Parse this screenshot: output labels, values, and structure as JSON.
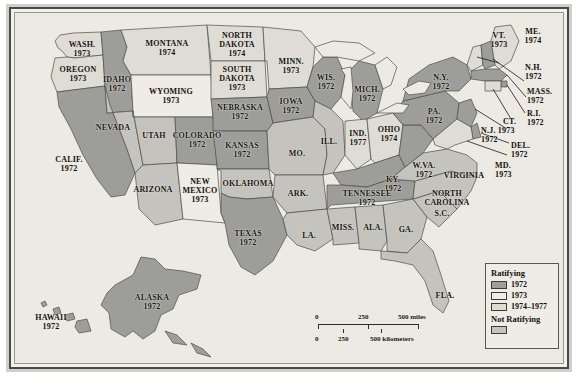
{
  "map": {
    "title": "Ratification of the Equal Rights Amendment by State",
    "projection": "united-states-with-insets",
    "background_color": "#eceae3",
    "colors": {
      "ratifying_1972": "#9d9d99",
      "ratifying_1973": "#eeece5",
      "ratifying_1974_1977": "#dedcd4",
      "not_ratifying": "#c4c3bd",
      "border": "#585753",
      "text": "#121210"
    },
    "legend": {
      "title": "Ratifying",
      "items": [
        {
          "swatch": "ratifying_1972",
          "label": "1972"
        },
        {
          "swatch": "ratifying_1973",
          "label": "1973"
        },
        {
          "swatch": "ratifying_1974_1977",
          "label": "1974–1977"
        }
      ],
      "title2": "Not Ratifying",
      "items2": [
        {
          "swatch": "not_ratifying",
          "label": ""
        }
      ]
    },
    "scale_bar": {
      "miles": {
        "ticks": [
          "0",
          "250",
          "500 miles"
        ]
      },
      "kilometers": {
        "ticks": [
          "0",
          "250",
          "500 kilometers"
        ]
      }
    },
    "states": [
      {
        "name": "WASH.",
        "year": "1973",
        "status": "ratifying_1974_1977"
      },
      {
        "name": "OREGON",
        "year": "1973",
        "status": "ratifying_1974_1977"
      },
      {
        "name": "IDAHO",
        "year": "1972",
        "status": "ratifying_1972"
      },
      {
        "name": "MONTANA",
        "year": "1974",
        "status": "ratifying_1974_1977"
      },
      {
        "name": "WYOMING",
        "year": "1973",
        "status": "ratifying_1973"
      },
      {
        "name": "NORTH\nDAKOTA",
        "year": "1974",
        "status": "ratifying_1974_1977"
      },
      {
        "name": "SOUTH\nDAKOTA",
        "year": "1973",
        "status": "ratifying_1974_1977"
      },
      {
        "name": "MINN.",
        "year": "1973",
        "status": "ratifying_1974_1977"
      },
      {
        "name": "WIS.",
        "year": "1972",
        "status": "ratifying_1972"
      },
      {
        "name": "MICH.",
        "year": "1972",
        "status": "ratifying_1972"
      },
      {
        "name": "NEVADA",
        "year": "",
        "status": "not_ratifying"
      },
      {
        "name": "UTAH",
        "year": "",
        "status": "not_ratifying"
      },
      {
        "name": "COLORADO",
        "year": "1972",
        "status": "ratifying_1972"
      },
      {
        "name": "NEBRASKA",
        "year": "1972",
        "status": "ratifying_1972"
      },
      {
        "name": "IOWA",
        "year": "1972",
        "status": "ratifying_1972"
      },
      {
        "name": "ILL.",
        "year": "",
        "status": "not_ratifying"
      },
      {
        "name": "IND.",
        "year": "1977",
        "status": "ratifying_1974_1977"
      },
      {
        "name": "OHIO",
        "year": "1974",
        "status": "ratifying_1974_1977"
      },
      {
        "name": "PA.",
        "year": "1972",
        "status": "ratifying_1972"
      },
      {
        "name": "N.Y.",
        "year": "1972",
        "status": "ratifying_1972"
      },
      {
        "name": "VT.",
        "year": "1973",
        "status": "ratifying_1974_1977"
      },
      {
        "name": "ME.",
        "year": "1974",
        "status": "ratifying_1974_1977"
      },
      {
        "name": "N.H.",
        "year": "1972",
        "status": "ratifying_1972"
      },
      {
        "name": "MASS.",
        "year": "1972",
        "status": "ratifying_1972"
      },
      {
        "name": "R.I.",
        "year": "1972",
        "status": "ratifying_1972"
      },
      {
        "name": "CT.",
        "year": "1973",
        "status": "ratifying_1974_1977"
      },
      {
        "name": "N.J.",
        "year": "1972",
        "status": "ratifying_1972"
      },
      {
        "name": "DEL.",
        "year": "1972",
        "status": "ratifying_1972"
      },
      {
        "name": "MD.",
        "year": "1973",
        "status": "ratifying_1974_1977"
      },
      {
        "name": "W.VA.",
        "year": "1972",
        "status": "ratifying_1972"
      },
      {
        "name": "VIRGINIA",
        "year": "",
        "status": "not_ratifying"
      },
      {
        "name": "KY.",
        "year": "1972",
        "status": "ratifying_1972"
      },
      {
        "name": "TENNESSEE",
        "year": "1972",
        "status": "ratifying_1972"
      },
      {
        "name": "NORTH\nCAROLINA",
        "year": "",
        "status": "not_ratifying"
      },
      {
        "name": "S.C.",
        "year": "",
        "status": "not_ratifying"
      },
      {
        "name": "GA.",
        "year": "",
        "status": "not_ratifying"
      },
      {
        "name": "FLA.",
        "year": "",
        "status": "not_ratifying"
      },
      {
        "name": "ALA.",
        "year": "",
        "status": "not_ratifying"
      },
      {
        "name": "MISS.",
        "year": "",
        "status": "not_ratifying"
      },
      {
        "name": "LA.",
        "year": "",
        "status": "not_ratifying"
      },
      {
        "name": "ARK.",
        "year": "",
        "status": "not_ratifying"
      },
      {
        "name": "MO.",
        "year": "",
        "status": "not_ratifying"
      },
      {
        "name": "KANSAS",
        "year": "1972",
        "status": "ratifying_1972"
      },
      {
        "name": "OKLAHOMA",
        "year": "",
        "status": "not_ratifying"
      },
      {
        "name": "TEXAS",
        "year": "1972",
        "status": "ratifying_1972"
      },
      {
        "name": "NEW\nMEXICO",
        "year": "1973",
        "status": "ratifying_1973"
      },
      {
        "name": "ARIZONA",
        "year": "",
        "status": "not_ratifying"
      },
      {
        "name": "CALIF.",
        "year": "1972",
        "status": "ratifying_1972"
      },
      {
        "name": "ALASKA",
        "year": "1972",
        "status": "ratifying_1972"
      },
      {
        "name": "HAWAII",
        "year": "1972",
        "status": "ratifying_1972"
      }
    ],
    "labels": {
      "wash": {
        "name": "WASH.",
        "year": "1973"
      },
      "oregon": {
        "name": "OREGON",
        "year": "1973"
      },
      "idaho": {
        "name": "IDAHO",
        "year": "1972"
      },
      "montana": {
        "name": "MONTANA",
        "year": "1974"
      },
      "wyoming": {
        "name": "WYOMING",
        "year": "1973"
      },
      "ndak1": {
        "name": "NORTH",
        "name2": "DAKOTA",
        "year": "1974"
      },
      "sdak1": {
        "name": "SOUTH",
        "name2": "DAKOTA",
        "year": "1973"
      },
      "minn": {
        "name": "MINN.",
        "year": "1973"
      },
      "wis": {
        "name": "WIS.",
        "year": "1972"
      },
      "mich": {
        "name": "MICH.",
        "year": "1972"
      },
      "nevada": {
        "name": "NEVADA",
        "year": ""
      },
      "utah": {
        "name": "UTAH",
        "year": ""
      },
      "colorado": {
        "name": "COLORADO",
        "year": "1972"
      },
      "nebraska": {
        "name": "NEBRASKA",
        "year": "1972"
      },
      "iowa": {
        "name": "IOWA",
        "year": "1972"
      },
      "ill": {
        "name": "ILL.",
        "year": ""
      },
      "ind": {
        "name": "IND.",
        "year": "1977"
      },
      "ohio": {
        "name": "OHIO",
        "year": "1974"
      },
      "pa": {
        "name": "PA.",
        "year": "1972"
      },
      "ny": {
        "name": "N.Y.",
        "year": "1972"
      },
      "vt": {
        "name": "VT.",
        "year": "1973"
      },
      "me": {
        "name": "ME.",
        "year": "1974"
      },
      "nh": {
        "name": "N.H.",
        "year": "1972"
      },
      "mass": {
        "name": "MASS.",
        "year": "1972"
      },
      "ri": {
        "name": "R.I.",
        "year": "1972"
      },
      "ct": {
        "name": "CT.",
        "year": ""
      },
      "nj": {
        "name": "N.J. 1973",
        "year": "1972"
      },
      "del": {
        "name": "DEL.",
        "year": "1972"
      },
      "md": {
        "name": "MD.",
        "year": "1973"
      },
      "wva": {
        "name": "W.VA.",
        "year": "1972"
      },
      "virginia": {
        "name": "VIRGINIA",
        "year": ""
      },
      "ky": {
        "name": "KY.",
        "year": "1972"
      },
      "tenn": {
        "name": "TENNESSEE",
        "year": "1972"
      },
      "ncar1": {
        "name": "NORTH",
        "name2": "CAROLINA",
        "year": ""
      },
      "scar": {
        "name": "S.C.",
        "year": ""
      },
      "ga": {
        "name": "GA.",
        "year": ""
      },
      "fla": {
        "name": "FLA.",
        "year": ""
      },
      "ala": {
        "name": "ALA.",
        "year": ""
      },
      "miss": {
        "name": "MISS.",
        "year": ""
      },
      "la": {
        "name": "LA.",
        "year": ""
      },
      "ark": {
        "name": "ARK.",
        "year": ""
      },
      "mo": {
        "name": "MO.",
        "year": ""
      },
      "kansas": {
        "name": "KANSAS",
        "year": "1972"
      },
      "okla": {
        "name": "OKLAHOMA",
        "year": ""
      },
      "texas": {
        "name": "TEXAS",
        "year": "1972"
      },
      "nmex1": {
        "name": "NEW",
        "name2": "MEXICO",
        "year": "1973"
      },
      "arizona": {
        "name": "ARIZONA",
        "year": ""
      },
      "calif": {
        "name": "CALIF.",
        "year": "1972"
      },
      "alaska": {
        "name": "ALASKA",
        "year": "1972"
      },
      "hawaii": {
        "name": "HAWAII",
        "year": "1972"
      }
    }
  }
}
